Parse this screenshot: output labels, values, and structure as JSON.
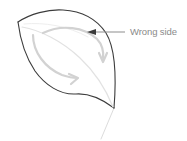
{
  "figure": {
    "background_color": "#ffffff"
  },
  "annotation": {
    "label": "Wrong side",
    "text_color": "#8a8a8a",
    "leader_line_color": "#8d8d8d",
    "arrow_color": "#3a3a3a"
  },
  "leaf": {
    "outline_color": "#3c3c3c",
    "fill_color": "#ffffff",
    "vein_color": "#e2e2e2",
    "stem_color": "#dcdcdc"
  },
  "fold_arrows": {
    "color": "#d2d2d2",
    "items": [
      {
        "name": "upper-fold-arrow"
      },
      {
        "name": "lower-fold-arrow"
      }
    ]
  }
}
